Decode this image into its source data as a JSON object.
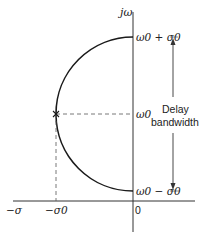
{
  "diagram": {
    "type": "s-plane pole locus",
    "axes": {
      "vertical_label": "jω",
      "negative_horizontal_label": "−σ",
      "origin_label": "0"
    },
    "points": {
      "pole_marker": "×",
      "sigma0_label": "−σ0",
      "omega0_label": "ω0",
      "top_label": "ω0 + σ0",
      "bottom_label": "ω0 − σ0"
    },
    "annotation": {
      "line1": "Delay",
      "line2": "bandwidth"
    },
    "colors": {
      "stroke": "#1a1a1a",
      "axis": "#333333",
      "dashed": "#555555"
    }
  }
}
